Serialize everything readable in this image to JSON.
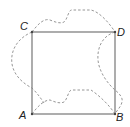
{
  "figure": {
    "type": "geometry-square-with-dashed-curved-region",
    "square": {
      "vertices": [
        {
          "label": "A",
          "x": 32,
          "y": 114
        },
        {
          "label": "B",
          "x": 115,
          "y": 114
        },
        {
          "label": "D",
          "x": 115,
          "y": 32
        },
        {
          "label": "C",
          "x": 32,
          "y": 32
        }
      ],
      "stroke_color": "#6a6a6a"
    },
    "labels": {
      "A": "A",
      "B": "B",
      "C": "C",
      "D": "D"
    },
    "dashed_curve_color": "#8a8a8a"
  }
}
